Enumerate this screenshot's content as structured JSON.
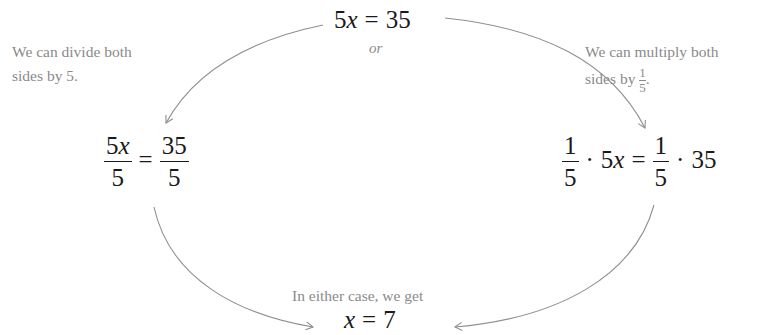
{
  "top_equation": {
    "coef": "5",
    "var": "x",
    "eq": "=",
    "rhs": "35"
  },
  "or_label": "or",
  "left_note": {
    "line1": "We can divide both",
    "line2": "sides by 5."
  },
  "right_note": {
    "line1": "We can multiply both",
    "line2_prefix": "sides by",
    "frac_num": "1",
    "frac_den": "5",
    "line2_suffix": "."
  },
  "left_equation": {
    "lhs_num_coef": "5",
    "lhs_num_var": "x",
    "lhs_den": "5",
    "eq": "=",
    "rhs_num": "35",
    "rhs_den": "5"
  },
  "right_equation": {
    "lhs_frac_num": "1",
    "lhs_frac_den": "5",
    "dot1": "·",
    "lhs_coef": "5",
    "lhs_var": "x",
    "eq": "=",
    "rhs_frac_num": "1",
    "rhs_frac_den": "5",
    "dot2": "·",
    "rhs_val": "35"
  },
  "result_note": "In either case, we get",
  "result_equation": {
    "var": "x",
    "eq": "=",
    "val": "7"
  },
  "colors": {
    "equation": "#1a1a1a",
    "note": "#8a8a8a",
    "arrow": "#8f8f8f"
  }
}
